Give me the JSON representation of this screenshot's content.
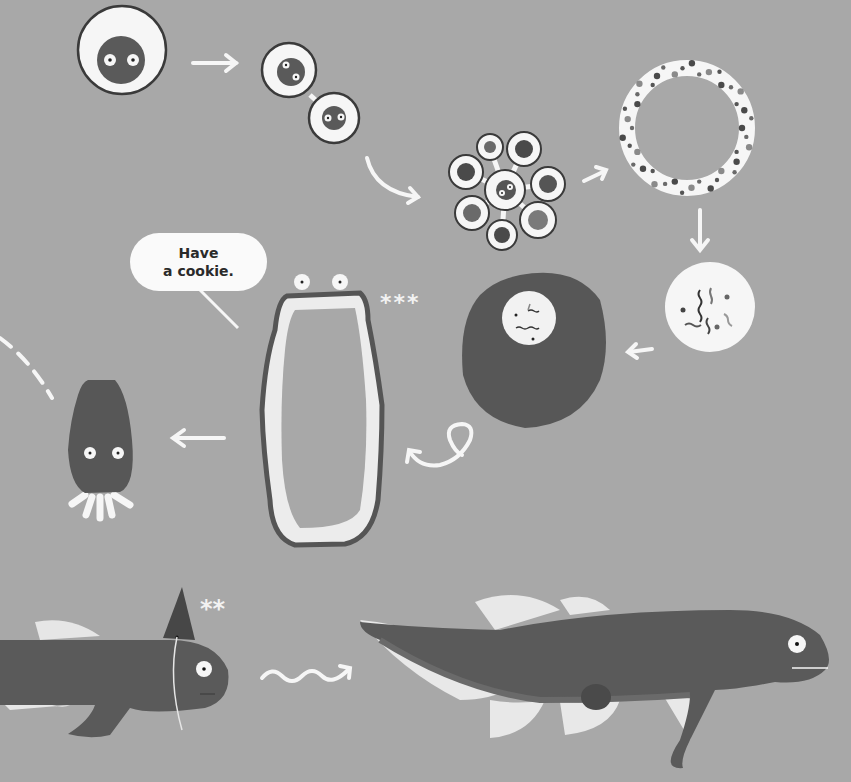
{
  "scene": {
    "title": "Evolution storyboard illustration",
    "background_color": "#a8a8a8",
    "speech_bubble": {
      "line1": "Have",
      "line2": "a cookie."
    },
    "annotations": {
      "sponge_stars": "***",
      "fish_stars": "**"
    },
    "stages": [
      {
        "id": "single-cell",
        "label": "single cell"
      },
      {
        "id": "two-cells",
        "label": "two cells"
      },
      {
        "id": "cell-cluster",
        "label": "cell cluster"
      },
      {
        "id": "hollow-ball",
        "label": "hollow ball of cells"
      },
      {
        "id": "gene-cell",
        "label": "cell with DNA"
      },
      {
        "id": "dark-blob",
        "label": "dark blob with nucleus"
      },
      {
        "id": "sponge",
        "label": "sponge-like creature"
      },
      {
        "id": "jellyfish",
        "label": "jellyfish-like creature"
      },
      {
        "id": "early-fish",
        "label": "early fish with party hat"
      },
      {
        "id": "lobe-fish",
        "label": "lobe-finned fish"
      }
    ],
    "colors": {
      "dark": "#5a5a5a",
      "darker": "#4a4a4a",
      "white": "#f6f6f6",
      "outline": "#3a3a3a",
      "mid": "#7a7a7a"
    }
  }
}
